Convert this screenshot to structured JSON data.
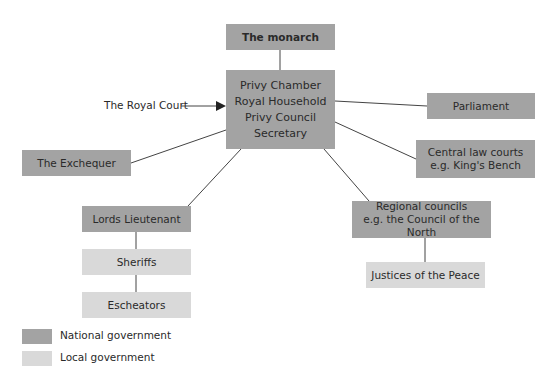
{
  "diagram": {
    "center": {
      "lines": [
        "Privy Chamber",
        "Royal Household",
        "Privy Council",
        "Secretary"
      ]
    },
    "monarch": "The monarch",
    "royal_court": "The Royal Court",
    "parliament": "Parliament",
    "exchequer": "The Exchequer",
    "central_law": {
      "line1": "Central law courts",
      "line2": "e.g. King's Bench"
    },
    "lords_lieutenant": "Lords Lieutenant",
    "sheriffs": "Sheriffs",
    "escheators": "Escheators",
    "regional": {
      "line1": "Regional councils",
      "line2": "e.g. the Council of the North"
    },
    "justices": "Justices of the Peace"
  },
  "legend": {
    "national": {
      "label": "National government",
      "color": "#a3a3a3"
    },
    "local": {
      "label": "Local government",
      "color": "#d9d9d9"
    }
  }
}
